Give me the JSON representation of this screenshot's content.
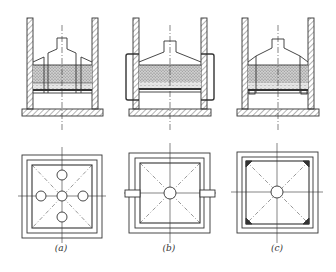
{
  "figure": {
    "type": "engineering cross-section and plan view diagram",
    "panels": [
      {
        "id": "a",
        "label": "(a)",
        "label_x": 61,
        "label_y": 249,
        "section_center_x": 62,
        "plan_center_x": 62,
        "plan_center_y": 197,
        "feature": "central plus four surrounding circular openings"
      },
      {
        "id": "b",
        "label": "(b)",
        "label_x": 169,
        "label_y": 249,
        "section_center_x": 170,
        "plan_center_x": 170,
        "plan_center_y": 193,
        "feature": "external side pipes connecting through walls"
      },
      {
        "id": "c",
        "label": "(c)",
        "label_x": 277,
        "label_y": 249,
        "section_center_x": 278,
        "plan_center_x": 277,
        "plan_center_y": 192,
        "feature": "corner support blocks"
      }
    ],
    "colors": {
      "line": "#333333",
      "fill_granular": "#b8b8b8",
      "background": "#ffffff"
    }
  }
}
